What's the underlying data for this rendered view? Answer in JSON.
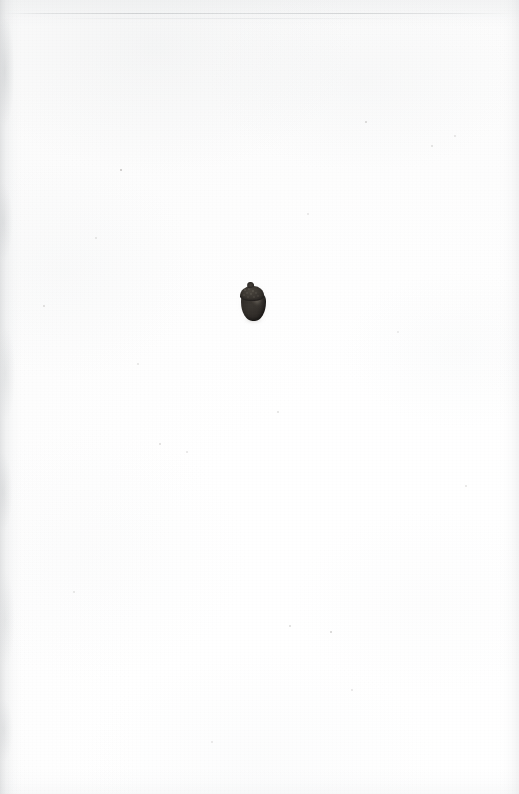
{
  "plate": {
    "kind": "scanned-botanical-plate",
    "page_width": 519,
    "page_height": 794,
    "caption": "",
    "background_color": "#fdfdfd",
    "paper_tone": "#fbfbfb"
  },
  "specimen": {
    "name": "acorn",
    "description": "single dark acorn specimen, cap uppermost",
    "center_x": 253,
    "center_y": 303,
    "width": 28,
    "height": 38,
    "cap_color": "#3d3933",
    "body_color": "#322e2a",
    "shadow_color": "#605c57",
    "parts": {
      "tip_label": "stalk tip",
      "cap_label": "cupule (cap)",
      "body_label": "nut body"
    }
  },
  "scan_artifacts": {
    "left_edge_shade": "#c4c6c8",
    "right_edge_shade": "#d0d2d4",
    "top_band_shade": "#e2e4e5",
    "hairline_color": "#b0b3b6",
    "specks": [
      {
        "x": 121,
        "y": 170,
        "size": 2.2,
        "opacity": 0.38
      },
      {
        "x": 366,
        "y": 122,
        "size": 1.8,
        "opacity": 0.26
      },
      {
        "x": 290,
        "y": 626,
        "size": 2.0,
        "opacity": 0.24
      },
      {
        "x": 331,
        "y": 632,
        "size": 2.4,
        "opacity": 0.3
      },
      {
        "x": 160,
        "y": 444,
        "size": 1.6,
        "opacity": 0.2
      },
      {
        "x": 187,
        "y": 452,
        "size": 1.4,
        "opacity": 0.16
      },
      {
        "x": 278,
        "y": 412,
        "size": 1.5,
        "opacity": 0.18
      },
      {
        "x": 44,
        "y": 306,
        "size": 1.6,
        "opacity": 0.2
      },
      {
        "x": 432,
        "y": 146,
        "size": 1.5,
        "opacity": 0.18
      },
      {
        "x": 455,
        "y": 136,
        "size": 1.4,
        "opacity": 0.16
      },
      {
        "x": 96,
        "y": 238,
        "size": 1.3,
        "opacity": 0.15
      },
      {
        "x": 352,
        "y": 690,
        "size": 1.5,
        "opacity": 0.16
      },
      {
        "x": 212,
        "y": 742,
        "size": 1.4,
        "opacity": 0.14
      },
      {
        "x": 466,
        "y": 486,
        "size": 1.5,
        "opacity": 0.17
      },
      {
        "x": 74,
        "y": 592,
        "size": 1.4,
        "opacity": 0.15
      },
      {
        "x": 308,
        "y": 214,
        "size": 1.3,
        "opacity": 0.14
      },
      {
        "x": 138,
        "y": 364,
        "size": 1.4,
        "opacity": 0.15
      },
      {
        "x": 398,
        "y": 332,
        "size": 1.3,
        "opacity": 0.13
      }
    ]
  }
}
